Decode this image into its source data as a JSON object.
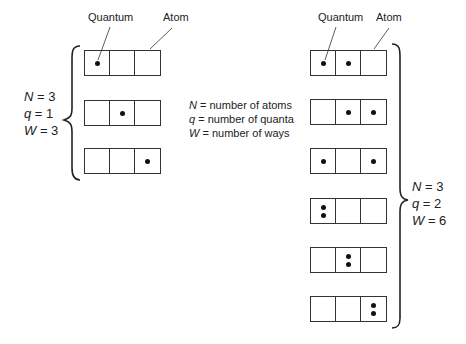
{
  "labels": {
    "quantum": "Quantum",
    "atom": "Atom"
  },
  "legend": [
    {
      "sym": "N",
      "text": "= number of atoms"
    },
    {
      "sym": "q",
      "text": "= number of quanta"
    },
    {
      "sym": "W",
      "text": "= number of ways"
    }
  ],
  "left_group": {
    "params": [
      {
        "sym": "N",
        "val": "= 3"
      },
      {
        "sym": "q",
        "val": "= 1"
      },
      {
        "sym": "W",
        "val": "= 3"
      }
    ],
    "configs": [
      [
        1,
        0,
        0
      ],
      [
        0,
        1,
        0
      ],
      [
        0,
        0,
        1
      ]
    ]
  },
  "right_group": {
    "params": [
      {
        "sym": "N",
        "val": "= 3"
      },
      {
        "sym": "q",
        "val": "= 2"
      },
      {
        "sym": "W",
        "val": "= 6"
      }
    ],
    "configs": [
      [
        1,
        1,
        0
      ],
      [
        0,
        1,
        1
      ],
      [
        1,
        0,
        1
      ],
      [
        2,
        0,
        0
      ],
      [
        0,
        2,
        0
      ],
      [
        0,
        0,
        2
      ]
    ]
  }
}
